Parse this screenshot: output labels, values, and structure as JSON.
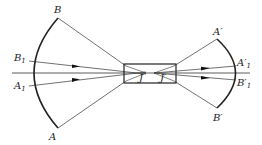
{
  "diagram": {
    "labels": {
      "B": "B",
      "B1": "B",
      "B1_sub": "1",
      "A1": "A",
      "A1_sub": "1",
      "A": "A",
      "J": "J",
      "Jprime": "J′",
      "Aprime": "A′",
      "A1prime": "A′",
      "A1prime_sub": "1",
      "B1prime": "B′",
      "B1prime_sub": "1",
      "Bprime": "B′"
    },
    "colors": {
      "line": "#333333",
      "arc": "#222222",
      "background": "#ffffff"
    }
  }
}
